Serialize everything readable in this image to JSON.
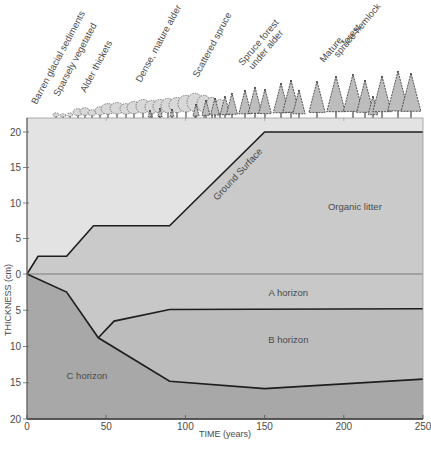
{
  "chart_data": {
    "type": "area",
    "title": "",
    "xlabel": "TIME (years)",
    "ylabel": "THICKNESS (cm)",
    "xlim": [
      0,
      250
    ],
    "ylim_above": [
      0,
      20
    ],
    "ylim_below": [
      0,
      20
    ],
    "x_ticks": [
      0,
      50,
      100,
      150,
      200,
      250
    ],
    "y_ticks_above": [
      0,
      5,
      10,
      15,
      20
    ],
    "y_ticks_below": [
      5,
      10,
      15,
      20
    ],
    "grid": false,
    "legend": "none",
    "succession_stages": [
      {
        "label": "Barren glacial sediments",
        "x": 6
      },
      {
        "label": "Sparsely vegetated",
        "x": 20
      },
      {
        "label": "Alder thickets",
        "x": 37
      },
      {
        "label": "Dense, mature alder",
        "x": 72
      },
      {
        "label": "Scattered spruce",
        "x": 108
      },
      {
        "label": "Spruce forest under alder",
        "x": 135
      },
      {
        "label": "Mature spruce-hemlock forest",
        "x": 190
      }
    ],
    "boundaries": {
      "ground_surface": {
        "x": [
          0,
          7,
          25,
          42,
          90,
          150,
          250
        ],
        "y": [
          0,
          2.5,
          2.5,
          6.8,
          6.8,
          20,
          20
        ]
      },
      "mineral_surface": {
        "x": [
          0,
          250
        ],
        "y": [
          0,
          0
        ]
      },
      "a_b_boundary": {
        "x": [
          45,
          55,
          90,
          250
        ],
        "y": [
          -8.8,
          -6.5,
          -4.9,
          -4.8
        ]
      },
      "c_boundary": {
        "x": [
          0,
          25,
          45,
          90,
          150,
          250
        ],
        "y": [
          0,
          -2.5,
          -8.8,
          -14.8,
          -15.8,
          -14.5
        ]
      }
    },
    "region_labels": [
      {
        "text": "Ground Surface",
        "x": 115,
        "y": 11
      },
      {
        "text": "Organic litter",
        "x": 190,
        "y": 9
      },
      {
        "text": "A horizon",
        "x": 165,
        "y": -3
      },
      {
        "text": "B horizon",
        "x": 165,
        "y": -9.5
      },
      {
        "text": "C horizon",
        "x": 25,
        "y": -14.5
      }
    ],
    "colors": {
      "air": "#e3e3e3",
      "organic_litter": "#cacaca",
      "a_horizon": "#c8c8c8",
      "b_horizon": "#bcbcbc",
      "c_horizon": "#a8a8a8",
      "line": "#1e1e1e",
      "zero_line": "#7a7a7a"
    }
  },
  "labels": {
    "xlabel": "TIME (years)",
    "ylabel": "THICKNESS (cm)",
    "ground_surface": "Ground Surface",
    "organic_litter": "Organic litter",
    "a_horizon": "A horizon",
    "b_horizon": "B horizon",
    "c_horizon": "C horizon"
  }
}
